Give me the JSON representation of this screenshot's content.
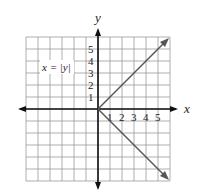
{
  "chart_data": {
    "type": "line",
    "title": "",
    "xlabel": "x",
    "ylabel": "y",
    "equation_label": "x = |y|",
    "x_ticks": [
      "1",
      "2",
      "3",
      "4",
      "5"
    ],
    "y_ticks": [
      "1",
      "2",
      "3",
      "4",
      "5"
    ],
    "xlim": [
      -6,
      6
    ],
    "ylim": [
      -6,
      6
    ],
    "grid": true,
    "series": [
      {
        "name": "x = |y| (upper branch, y >= 0)",
        "x": [
          0,
          6
        ],
        "y": [
          0,
          6
        ]
      },
      {
        "name": "x = |y| (lower branch, y <= 0)",
        "x": [
          0,
          6
        ],
        "y": [
          0,
          -6
        ]
      }
    ],
    "colors": {
      "grid": "#9a9a9a",
      "axis": "#111111",
      "curve": "#555555",
      "label_box": "#888888"
    }
  }
}
